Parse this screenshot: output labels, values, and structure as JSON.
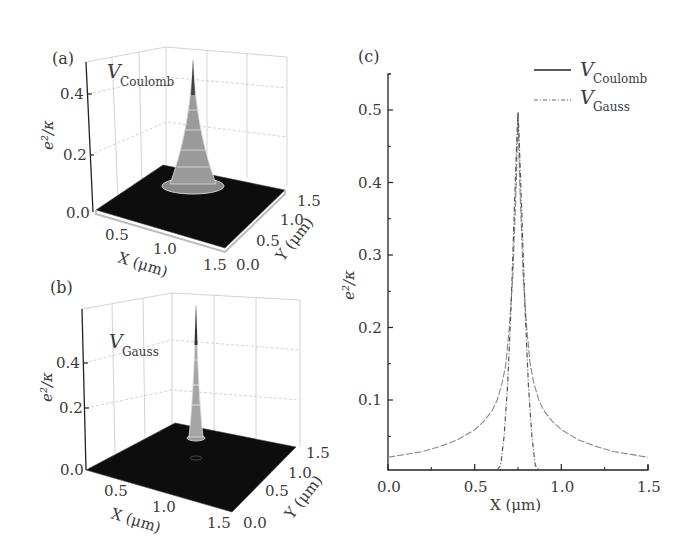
{
  "figure": {
    "panels": {
      "a": {
        "label": "(a)",
        "annotation_main": "V",
        "annotation_sub": "Coulomb"
      },
      "b": {
        "label": "(b)",
        "annotation_main": "V",
        "annotation_sub": "Gauss"
      },
      "c": {
        "label": "(c)"
      }
    },
    "legend": [
      {
        "main": "V",
        "sub": "Coulomb",
        "style": "solid"
      },
      {
        "main": "V",
        "sub": "Gauss",
        "style": "dash-dot"
      }
    ]
  },
  "chart_data": [
    {
      "panel": "(a)",
      "type": "surface3d",
      "title": "V_Coulomb",
      "xlabel": "X (μm)",
      "ylabel": "Y (μm)",
      "zlabel": "e²/κ",
      "x_ticks": [
        "0.5",
        "1.0",
        "1.5"
      ],
      "y_ticks": [
        "0.0",
        "0.5",
        "1.0",
        "1.5"
      ],
      "z_ticks": [
        "0.0",
        "0.2",
        "0.4"
      ],
      "xlim": [
        0,
        1.5
      ],
      "ylim": [
        0,
        1.5
      ],
      "zlim": [
        0,
        0.5
      ],
      "peak": {
        "x": 0.75,
        "y": 0.75,
        "z": 0.5
      },
      "grid": true
    },
    {
      "panel": "(b)",
      "type": "surface3d",
      "title": "V_Gauss",
      "xlabel": "X (μm)",
      "ylabel": "Y (μm)",
      "zlabel": "e²/κ",
      "x_ticks": [
        "0.5",
        "1.0",
        "1.5"
      ],
      "y_ticks": [
        "0.0",
        "0.5",
        "1.0",
        "1.5"
      ],
      "z_ticks": [
        "0.0",
        "0.2",
        "0.4"
      ],
      "xlim": [
        0,
        1.5
      ],
      "ylim": [
        0,
        1.5
      ],
      "zlim": [
        0,
        0.5
      ],
      "peak": {
        "x": 0.75,
        "y": 0.75,
        "z": 0.5
      },
      "grid": true
    },
    {
      "panel": "(c)",
      "type": "line",
      "title": "",
      "xlabel": "X (μm)",
      "ylabel": "e²/κ",
      "x_ticks": [
        "0.0",
        "0.5",
        "1.0",
        "1.5"
      ],
      "y_ticks": [
        "0.1",
        "0.2",
        "0.3",
        "0.4",
        "0.5"
      ],
      "xlim": [
        0,
        1.5
      ],
      "ylim": [
        0,
        0.55
      ],
      "grid": false,
      "legend_position": "upper right",
      "series": [
        {
          "name": "V_Coulomb",
          "style": "solid",
          "x": [
            0.0,
            0.1,
            0.2,
            0.3,
            0.4,
            0.5,
            0.55,
            0.6,
            0.63,
            0.66,
            0.68,
            0.7,
            0.72,
            0.74,
            0.75,
            0.76,
            0.78,
            0.8,
            0.82,
            0.84,
            0.87,
            0.9,
            0.95,
            1.0,
            1.1,
            1.2,
            1.3,
            1.4,
            1.5
          ],
          "y": [
            0.021,
            0.025,
            0.029,
            0.036,
            0.045,
            0.059,
            0.07,
            0.085,
            0.1,
            0.125,
            0.15,
            0.2,
            0.27,
            0.4,
            0.497,
            0.4,
            0.27,
            0.2,
            0.15,
            0.125,
            0.1,
            0.085,
            0.07,
            0.059,
            0.045,
            0.036,
            0.029,
            0.025,
            0.021
          ]
        },
        {
          "name": "V_Gauss",
          "style": "dash-dot",
          "x": [
            0.63,
            0.65,
            0.67,
            0.69,
            0.71,
            0.73,
            0.745,
            0.75,
            0.755,
            0.77,
            0.79,
            0.81,
            0.83,
            0.85,
            0.87
          ],
          "y": [
            0.0,
            0.01,
            0.05,
            0.12,
            0.23,
            0.37,
            0.47,
            0.497,
            0.47,
            0.37,
            0.23,
            0.12,
            0.05,
            0.01,
            0.0
          ]
        }
      ]
    }
  ]
}
